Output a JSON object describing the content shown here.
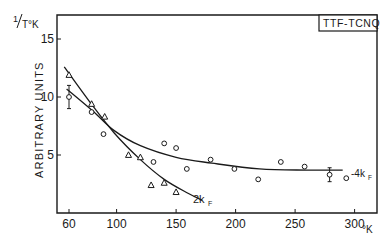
{
  "chart_data": {
    "type": "scatter",
    "title": "TTF-TCNQ",
    "ylabel_top": "1/T°K",
    "ylabel": "ARBITRARY UNITS",
    "xlabel": "°K",
    "xlim": [
      52,
      320
    ],
    "ylim": [
      0,
      17
    ],
    "x_ticks": [
      60,
      100,
      150,
      200,
      250,
      300
    ],
    "y_ticks": [
      5,
      10,
      15
    ],
    "grid": false,
    "legend": "none (curves labeled inline)",
    "series": [
      {
        "name": "2kF",
        "marker": "triangle",
        "points": [
          {
            "x": 60,
            "y": 11.9
          },
          {
            "x": 79,
            "y": 9.4
          },
          {
            "x": 90,
            "y": 8.3
          },
          {
            "x": 110,
            "y": 5.0
          },
          {
            "x": 120,
            "y": 4.8
          },
          {
            "x": 129,
            "y": 2.4
          },
          {
            "x": 140,
            "y": 2.6
          },
          {
            "x": 150,
            "y": 1.8
          }
        ],
        "fit_curve": [
          {
            "x": 56,
            "y": 12.6
          },
          {
            "x": 78,
            "y": 9.5
          },
          {
            "x": 98,
            "y": 6.9
          },
          {
            "x": 120,
            "y": 4.6
          },
          {
            "x": 140,
            "y": 2.9
          },
          {
            "x": 160,
            "y": 1.7
          },
          {
            "x": 172,
            "y": 1.1
          }
        ],
        "curve_label": "2kF"
      },
      {
        "name": "4kF",
        "marker": "circle",
        "points": [
          {
            "x": 60,
            "y": 10.0,
            "error_bar": 1.0
          },
          {
            "x": 79,
            "y": 8.7
          },
          {
            "x": 89,
            "y": 6.8
          },
          {
            "x": 131,
            "y": 4.4
          },
          {
            "x": 140,
            "y": 6.0
          },
          {
            "x": 150,
            "y": 5.6
          },
          {
            "x": 159,
            "y": 3.8
          },
          {
            "x": 179,
            "y": 4.6
          },
          {
            "x": 199,
            "y": 3.8
          },
          {
            "x": 219,
            "y": 2.9
          },
          {
            "x": 238,
            "y": 4.4
          },
          {
            "x": 258,
            "y": 4.0
          },
          {
            "x": 279,
            "y": 3.3,
            "error_bar": 0.6
          },
          {
            "x": 293,
            "y": 3.0
          }
        ],
        "fit_curve": [
          {
            "x": 58,
            "y": 10.7
          },
          {
            "x": 80,
            "y": 8.8
          },
          {
            "x": 98,
            "y": 7.1
          },
          {
            "x": 120,
            "y": 5.8
          },
          {
            "x": 150,
            "y": 4.8
          },
          {
            "x": 180,
            "y": 4.3
          },
          {
            "x": 220,
            "y": 3.8
          },
          {
            "x": 260,
            "y": 3.7
          },
          {
            "x": 290,
            "y": 3.7
          }
        ],
        "curve_label": "-4kF"
      }
    ]
  },
  "labels": {
    "box_title": "TTF-TCNQ",
    "y_unit_one": "1",
    "y_unit_rest": "T°K",
    "y_axis": "ARBITRARY UNITS",
    "x_unit": "°K",
    "curve_2kf": "2k",
    "curve_2kf_sub": "F",
    "curve_4kf": "-4k",
    "curve_4kf_sub": "F"
  }
}
